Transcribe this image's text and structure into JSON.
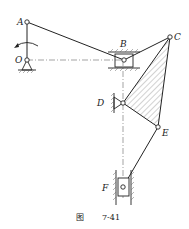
{
  "figure": {
    "caption_prefix": "图",
    "caption_number": "7-41"
  },
  "points": {
    "A": {
      "label": "A",
      "x": 27,
      "y": 22
    },
    "O": {
      "label": "O",
      "x": 27,
      "y": 60
    },
    "B": {
      "label": "B",
      "x": 124,
      "y": 60
    },
    "C": {
      "label": "C",
      "x": 170,
      "y": 37
    },
    "D": {
      "label": "D",
      "x": 123,
      "y": 103
    },
    "E": {
      "label": "E",
      "x": 158,
      "y": 127
    },
    "F": {
      "label": "F",
      "x": 123,
      "y": 187
    }
  },
  "colors": {
    "line": "#222222",
    "hatch": "#555555",
    "background": "#ffffff"
  }
}
